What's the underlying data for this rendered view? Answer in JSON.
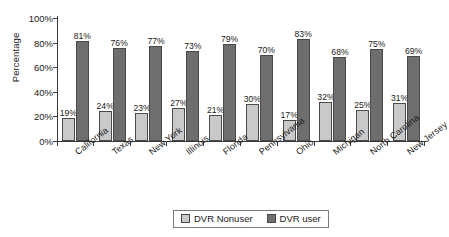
{
  "chart_data": {
    "type": "bar",
    "title": "",
    "subtitle": "",
    "xlabel": "",
    "ylabel": "Percentage",
    "ylim": [
      0,
      100
    ],
    "yticks": [
      "0%",
      "20%",
      "40%",
      "60%",
      "80%",
      "100%"
    ],
    "ytick_values": [
      0,
      20,
      40,
      60,
      80,
      100
    ],
    "grid": false,
    "legend_position": "bottom-center",
    "value_label_suffix": "%",
    "categories": [
      "California",
      "Texas",
      "New York",
      "Illinois",
      "Florida",
      "Pennsylvania",
      "Ohio",
      "Michigan",
      "North Carolina",
      "New Jersey"
    ],
    "series": [
      {
        "name": "DVR Nonuser",
        "color": "#c9c9c9",
        "values": [
          19,
          24,
          23,
          27,
          21,
          30,
          17,
          32,
          25,
          31
        ],
        "labels": [
          "19%",
          "24%",
          "23%",
          "27%",
          "21%",
          "30%",
          "17%",
          "32%",
          "25%",
          "31%"
        ]
      },
      {
        "name": "DVR user",
        "color": "#6e6e6e",
        "values": [
          81,
          76,
          77,
          73,
          79,
          70,
          83,
          68,
          75,
          69
        ],
        "labels": [
          "81%",
          "76%",
          "77%",
          "73%",
          "79%",
          "70%",
          "83%",
          "68%",
          "75%",
          "69%"
        ]
      }
    ]
  },
  "legend": {
    "items": [
      {
        "label": "DVR Nonuser",
        "swatch": "nonuser"
      },
      {
        "label": "DVR user",
        "swatch": "user"
      }
    ]
  }
}
